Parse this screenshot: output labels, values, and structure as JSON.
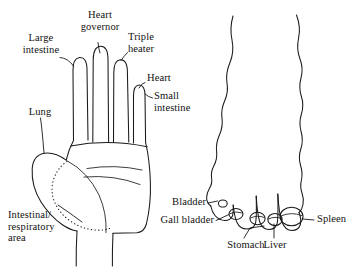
{
  "figure": {
    "kind": "reflexology-diagram",
    "background_color": "#ffffff",
    "ink_color": "#1a1a1a",
    "panels": [
      {
        "name": "hand-palm-view",
        "description": "Left hand, palm view with reflex zones"
      },
      {
        "name": "foot-top-view",
        "description": "Foot seen from above with toes at the bottom"
      }
    ]
  },
  "hand_labels": {
    "large_intestine": "Large\nintestine",
    "heart_governor": "Heart\ngovernor",
    "triple_heater": "Triple\nheater",
    "heart": "Heart",
    "small_intestine": "Small\nintestine",
    "lung": "Lung",
    "intestinal_respiratory_area": "Intestinal/\nrespiratory\narea"
  },
  "foot_labels": {
    "bladder": "Bladder",
    "gall_bladder": "Gall bladder",
    "stomach": "Stomach",
    "liver": "Liver",
    "spleen": "Spleen"
  }
}
